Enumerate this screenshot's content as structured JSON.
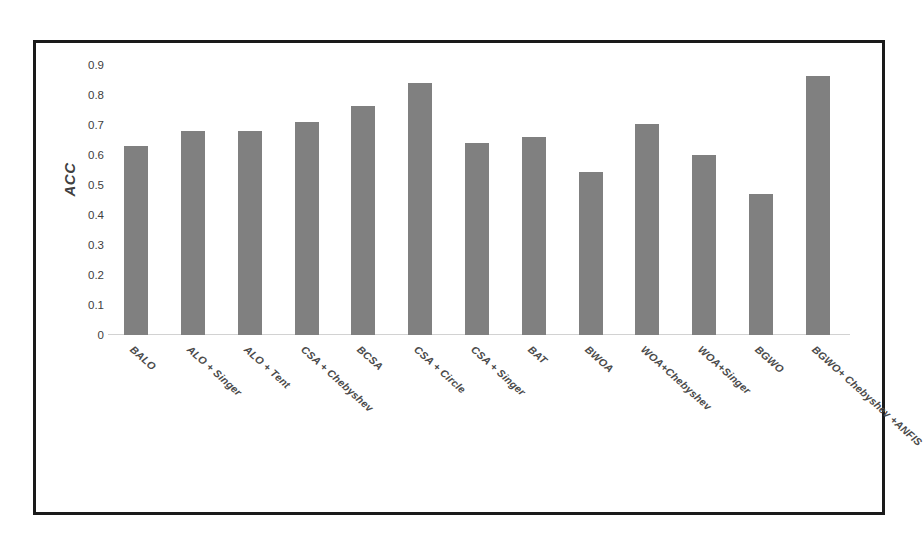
{
  "chart_data": {
    "type": "bar",
    "title": "",
    "xlabel": "",
    "ylabel": "ACC",
    "ylim": [
      0,
      0.9
    ],
    "grid": false,
    "legend": "none",
    "y_ticks": [
      "0.9",
      "0.8",
      "0.7",
      "0.6",
      "0.5",
      "0.4",
      "0.3",
      "0.2",
      "0.1",
      "0"
    ],
    "y_tick_values": [
      0.9,
      0.8,
      0.7,
      0.6,
      0.5,
      0.4,
      0.3,
      0.2,
      0.1,
      0
    ],
    "bar_color": "#808080",
    "categories": [
      "BALO",
      "ALO + Singer",
      "ALO + Tent",
      "CSA + Chebyshev",
      "BCSA",
      "CSA + Circle",
      "CSA + Singer",
      "BAT",
      "BWOA",
      "WOA+Chebyshev",
      "WOA+Singer",
      "BGWO",
      "BGWO+ Chebyshev +ANFIS"
    ],
    "values": [
      0.63,
      0.68,
      0.68,
      0.71,
      0.765,
      0.84,
      0.64,
      0.66,
      0.545,
      0.705,
      0.6,
      0.47,
      0.865
    ]
  }
}
